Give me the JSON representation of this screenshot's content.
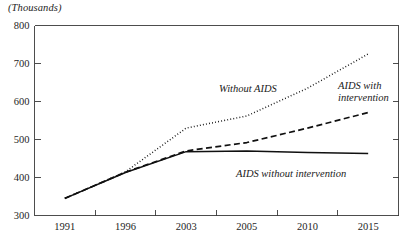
{
  "unit_label": "(Thousands)",
  "colors": {
    "axis": "#3a3a3a",
    "line": "#101010",
    "text": "#1a1a1a",
    "background": "#ffffff"
  },
  "annotations": {
    "without_aids": "Without AIDS",
    "aids_with_intervention_line1": "AIDS with",
    "aids_with_intervention_line2": "intervention",
    "aids_without_intervention": "AIDS without intervention"
  },
  "chart_data": {
    "type": "line",
    "title": "",
    "subtitle": "",
    "xlabel": "",
    "ylabel": "(Thousands)",
    "ylim": [
      300,
      800
    ],
    "yticks": [
      300,
      400,
      500,
      600,
      700,
      800
    ],
    "ytick_labels": [
      "300",
      "400",
      "500",
      "600",
      "700",
      "800"
    ],
    "categories": [
      "1991",
      "1996",
      "2003",
      "2005",
      "2010",
      "2015"
    ],
    "x": [
      1991,
      1996,
      2003,
      2005,
      2010,
      2015
    ],
    "grid": false,
    "legend": "inline-annotations",
    "axis_style": "categorical-even-spacing",
    "series": [
      {
        "name": "Without AIDS",
        "style": "dotted",
        "values": [
          345,
          415,
          530,
          562,
          635,
          725
        ]
      },
      {
        "name": "AIDS with intervention",
        "style": "dashed",
        "values": [
          345,
          414,
          470,
          492,
          530,
          571
        ]
      },
      {
        "name": "AIDS without intervention",
        "style": "solid",
        "values": [
          345,
          413,
          468,
          470,
          466,
          463
        ]
      }
    ]
  }
}
